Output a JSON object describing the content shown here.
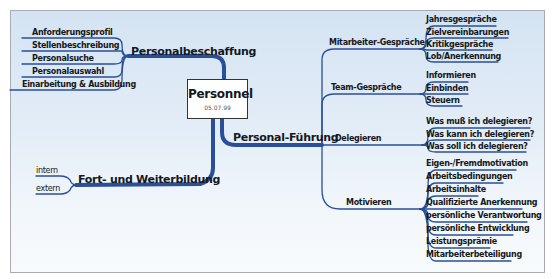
{
  "center": {
    "title": "Personnel",
    "date": "05.07.99"
  },
  "colors": {
    "branch_main": "#2a4f9a",
    "branch_thin": "#3a5a99",
    "text": "#141820",
    "bg_top": "#d4e3f3",
    "bg_bottom": "#f8fbfd"
  },
  "branches": {
    "personalbeschaffung": {
      "label": "Personalbeschaffung",
      "items": [
        "Anforderungsprofil",
        "Stellenbeschreibung",
        "Personalsuche",
        "Personalauswahl",
        "Einarbeitung & Ausbildung"
      ]
    },
    "weiterbildung": {
      "label": "Fort- und Weiterbildung",
      "items": [
        "intern",
        "extern"
      ]
    },
    "fuehrung": {
      "label": "Personal-Führung",
      "subs": [
        {
          "label": "Mitarbeiter-Gespräche",
          "items": [
            "Jahresgespräche",
            "Zielvereinbarungen",
            "Kritikgespräche",
            "Lob/Anerkennung"
          ]
        },
        {
          "label": "Team-Gespräche",
          "items": [
            "Informieren",
            "Einbinden",
            "Steuern"
          ]
        },
        {
          "label": "Delegieren",
          "items": [
            "Was muß ich delegieren?",
            "Was kann ich delegieren?",
            "Was soll ich delegieren?"
          ]
        },
        {
          "label": "Motivieren",
          "items": [
            "Eigen-/Fremdmotivation",
            "Arbeitsbedingungen",
            "Arbeitsinhalte",
            "Qualifizierte Anerkennung",
            "persönliche Verantwortung",
            "persönliche Entwicklung",
            "Leistungsprämie",
            "Mitarbeiterbeteiligung"
          ]
        }
      ]
    }
  }
}
